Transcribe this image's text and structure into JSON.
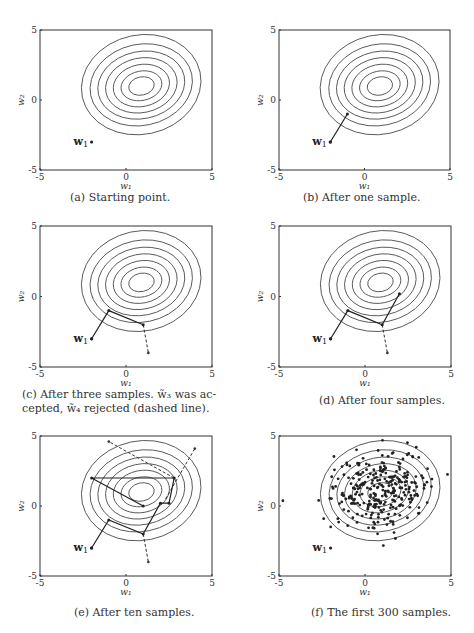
{
  "figure": {
    "axes": {
      "xlim": [
        -5,
        5
      ],
      "ylim": [
        -5,
        5
      ],
      "xticks": [
        "-5",
        "0",
        "5"
      ],
      "yticks": [
        "-5",
        "0",
        "5"
      ],
      "xlabel": "w₁",
      "ylabel": "w₂"
    },
    "start_label": "w",
    "start_sub": "1",
    "contour_center": [
      0.9,
      1.0
    ],
    "panels": [
      {
        "id": "a",
        "caption": "(a) Starting point."
      },
      {
        "id": "b",
        "caption": "(b) After one sample."
      },
      {
        "id": "c",
        "caption_line1": "(c) After three samples. w̃₃ was ac-",
        "caption_line2": "cepted, w̃₄ rejected (dashed line)."
      },
      {
        "id": "d",
        "caption": "(d) After four samples."
      },
      {
        "id": "e",
        "caption": "(e) After ten samples."
      },
      {
        "id": "f",
        "caption": "(f) The first 300 samples."
      }
    ]
  },
  "chart_data": [
    {
      "type": "line",
      "title": "(a) Starting point.",
      "xlabel": "w1",
      "ylabel": "w2",
      "xlim": [
        -5,
        5
      ],
      "ylim": [
        -5,
        5
      ],
      "points": [
        [
          -2,
          -3
        ]
      ],
      "accepted_path": [],
      "rejected": []
    },
    {
      "type": "line",
      "title": "(b) After one sample.",
      "xlabel": "w1",
      "ylabel": "w2",
      "xlim": [
        -5,
        5
      ],
      "ylim": [
        -5,
        5
      ],
      "accepted_path": [
        [
          -2,
          -3
        ],
        [
          -1,
          -1
        ]
      ],
      "rejected": []
    },
    {
      "type": "line",
      "title": "(c) After three samples.",
      "xlabel": "w1",
      "ylabel": "w2",
      "xlim": [
        -5,
        5
      ],
      "ylim": [
        -5,
        5
      ],
      "accepted_path": [
        [
          -2,
          -3
        ],
        [
          -1,
          -1
        ],
        [
          1,
          -2
        ]
      ],
      "rejected": [
        [
          [
            1,
            -2
          ],
          [
            1.3,
            -4
          ]
        ]
      ]
    },
    {
      "type": "line",
      "title": "(d) After four samples.",
      "xlabel": "w1",
      "ylabel": "w2",
      "xlim": [
        -5,
        5
      ],
      "ylim": [
        -5,
        5
      ],
      "accepted_path": [
        [
          -2,
          -3
        ],
        [
          -1,
          -1
        ],
        [
          1,
          -2
        ],
        [
          2,
          0.2
        ]
      ],
      "rejected": [
        [
          [
            1,
            -2
          ],
          [
            1.3,
            -4
          ]
        ]
      ]
    },
    {
      "type": "line",
      "title": "(e) After ten samples.",
      "xlabel": "w1",
      "ylabel": "w2",
      "xlim": [
        -5,
        5
      ],
      "ylim": [
        -5,
        5
      ],
      "accepted_path": [
        [
          -2,
          -3
        ],
        [
          -1,
          -1
        ],
        [
          1,
          -2
        ],
        [
          2,
          0.2
        ],
        [
          2.5,
          0.2
        ],
        [
          2.8,
          2
        ],
        [
          -2,
          2
        ],
        [
          1,
          0
        ]
      ],
      "rejected": [
        [
          [
            1,
            -2
          ],
          [
            1.3,
            -4
          ]
        ],
        [
          [
            2.8,
            2
          ],
          [
            -1,
            4.6
          ]
        ],
        [
          [
            2.3,
            0.5
          ],
          [
            4,
            4.1
          ]
        ]
      ]
    },
    {
      "type": "scatter",
      "title": "(f) The first 300 samples.",
      "xlabel": "w1",
      "ylabel": "w2",
      "xlim": [
        -5,
        5
      ],
      "ylim": [
        -5,
        5
      ],
      "n_points": 300,
      "approx_mean": [
        0.9,
        1.0
      ]
    }
  ]
}
